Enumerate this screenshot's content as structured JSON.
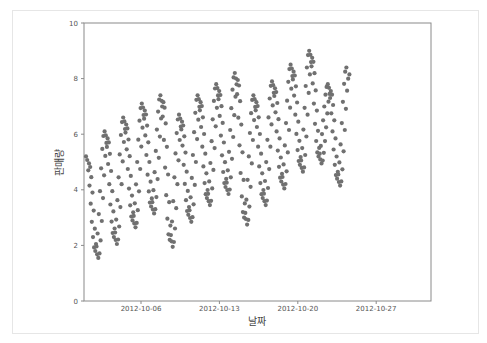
{
  "chart_data": {
    "type": "scatter",
    "title": "",
    "xlabel": "날짜",
    "ylabel": "판매량",
    "ylim": [
      0,
      10
    ],
    "yticks": [
      0,
      2,
      4,
      6,
      8,
      10
    ],
    "xticks": [
      "2012-10-06",
      "2012-10-13",
      "2012-10-20",
      "2012-10-27"
    ],
    "xlim": [
      "2012-10-01",
      "2012-10-31"
    ],
    "grid": false,
    "marker_color": "#707070",
    "x_range_of_data": [
      "2012-10-01",
      "2012-10-24"
    ],
    "cycles": [
      {
        "peak": 5.2,
        "trough": 1.8
      },
      {
        "peak": 6.1,
        "trough": 2.3
      },
      {
        "peak": 6.6,
        "trough": 2.9
      },
      {
        "peak": 7.1,
        "trough": 3.4
      },
      {
        "peak": 7.4,
        "trough": 2.2
      },
      {
        "peak": 6.7,
        "trough": 3.1
      },
      {
        "peak": 7.4,
        "trough": 3.7
      },
      {
        "peak": 7.8,
        "trough": 4.1
      },
      {
        "peak": 8.2,
        "trough": 3.0
      },
      {
        "peak": 7.4,
        "trough": 3.7
      },
      {
        "peak": 7.9,
        "trough": 4.3
      },
      {
        "peak": 8.5,
        "trough": 4.9
      },
      {
        "peak": 9.0,
        "trough": 5.2
      },
      {
        "peak": 7.8,
        "trough": 4.4
      },
      {
        "peak": 8.4,
        "trough": 4.4
      }
    ]
  }
}
